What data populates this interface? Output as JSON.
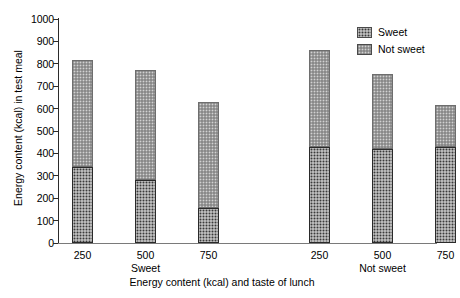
{
  "chart_data": {
    "type": "bar",
    "subtype": "stacked-bar-grouped",
    "title": "",
    "xlabel": "Energy content (kcal) and taste of lunch",
    "ylabel": "Energy content (kcal) in test meal",
    "ylim": [
      0,
      1000
    ],
    "ytick_step": 100,
    "yticks": [
      "1000",
      "900",
      "800",
      "700",
      "600",
      "500",
      "400",
      "300",
      "200",
      "100",
      "0"
    ],
    "ytick_values": [
      1000,
      900,
      800,
      700,
      600,
      500,
      400,
      300,
      200,
      100,
      0
    ],
    "grid": false,
    "legend_position": "top-right",
    "groups": [
      {
        "name": "Sweet",
        "categories": [
          "250",
          "500",
          "750"
        ]
      },
      {
        "name": "Not sweet",
        "categories": [
          "250",
          "500",
          "750"
        ]
      }
    ],
    "categories": [
      "250",
      "500",
      "750",
      "250",
      "500",
      "750"
    ],
    "series": [
      {
        "name": "Sweet",
        "color": "#3a3a3a",
        "pattern": "dark-checker",
        "values": [
          340,
          280,
          155,
          430,
          418,
          430
        ]
      },
      {
        "name": "Not sweet",
        "color": "#d2d2d2",
        "pattern": "light-hatch",
        "values": [
          478,
          492,
          473,
          430,
          337,
          185
        ]
      }
    ],
    "totals": [
      818,
      772,
      628,
      860,
      755,
      615
    ],
    "bars": [
      {
        "group": "Sweet",
        "category": "250",
        "sweet": 340,
        "not_sweet": 478,
        "total": 818
      },
      {
        "group": "Sweet",
        "category": "500",
        "sweet": 280,
        "not_sweet": 492,
        "total": 772
      },
      {
        "group": "Sweet",
        "category": "750",
        "sweet": 155,
        "not_sweet": 473,
        "total": 628
      },
      {
        "group": "Not sweet",
        "category": "250",
        "sweet": 430,
        "not_sweet": 430,
        "total": 860
      },
      {
        "group": "Not sweet",
        "category": "500",
        "sweet": 418,
        "not_sweet": 337,
        "total": 755
      },
      {
        "group": "Not sweet",
        "category": "750",
        "sweet": 430,
        "not_sweet": 185,
        "total": 615
      }
    ]
  },
  "legend": {
    "items": [
      {
        "label": "Sweet",
        "swatch": "dark-checker-swatch"
      },
      {
        "label": "Not sweet",
        "swatch": "light-hatch-swatch"
      }
    ]
  },
  "axis": {
    "y_title": "Energy content (kcal) in test meal",
    "x_title": "Energy content (kcal) and taste of lunch"
  }
}
